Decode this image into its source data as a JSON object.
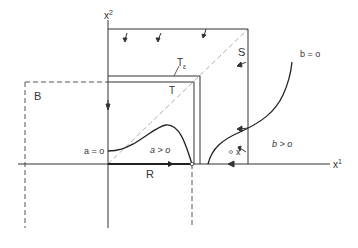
{
  "diagram": {
    "axes": {
      "x1_label": "x",
      "x1_sup": "1",
      "x2_label": "x",
      "x2_sup": "2"
    },
    "regions": {
      "S": "S",
      "T_eps": "T",
      "T_eps_sub": "ε",
      "T": "T",
      "B": "B",
      "R": "R"
    },
    "curves": {
      "a_zero": "a = o",
      "a_pos": "a > o",
      "b_zero": "b = o",
      "b_pos": "b > o"
    },
    "point": {
      "marker": "°",
      "label": "x"
    },
    "colors": {
      "line": "#333333",
      "dashed": "#555555",
      "diagonal": "#999999"
    }
  }
}
